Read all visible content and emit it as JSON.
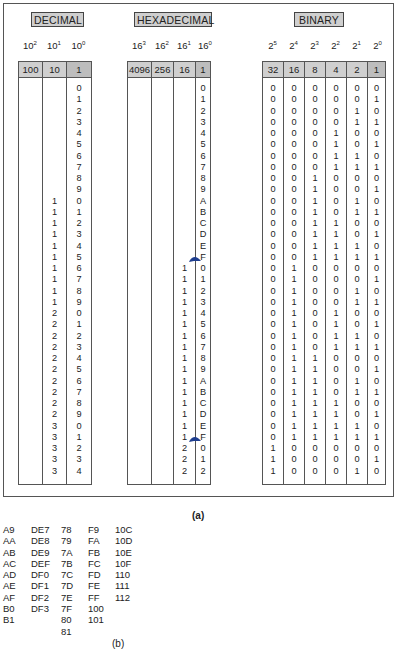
{
  "panel_a": {
    "caption": "(a)",
    "decimal": {
      "title": "DECIMAL",
      "powers": [
        {
          "base": "10",
          "exp": "2"
        },
        {
          "base": "10",
          "exp": "1"
        },
        {
          "base": "10",
          "exp": "0"
        }
      ],
      "weights": [
        "100",
        "10",
        "1"
      ],
      "columns": [
        [],
        [
          "",
          "",
          "",
          "",
          "",
          "",
          "",
          "",
          "",
          "",
          "1",
          "1",
          "1",
          "1",
          "1",
          "1",
          "1",
          "1",
          "1",
          "1",
          "2",
          "2",
          "2",
          "2",
          "2",
          "2",
          "2",
          "2",
          "2",
          "2",
          "3",
          "3",
          "3",
          "3",
          "3"
        ],
        [
          "0",
          "1",
          "2",
          "3",
          "4",
          "5",
          "6",
          "7",
          "8",
          "9",
          "0",
          "1",
          "2",
          "3",
          "4",
          "5",
          "6",
          "7",
          "8",
          "9",
          "0",
          "1",
          "2",
          "3",
          "4",
          "5",
          "6",
          "7",
          "8",
          "9",
          "0",
          "1",
          "2",
          "3",
          "4"
        ]
      ]
    },
    "hexadecimal": {
      "title": "HEXADECIMAL",
      "powers": [
        {
          "base": "16",
          "exp": "3"
        },
        {
          "base": "16",
          "exp": "2"
        },
        {
          "base": "16",
          "exp": "1"
        },
        {
          "base": "16",
          "exp": "0"
        }
      ],
      "weights": [
        "4096",
        "256",
        "16",
        "1"
      ],
      "columns": [
        [],
        [],
        [
          "",
          "",
          "",
          "",
          "",
          "",
          "",
          "",
          "",
          "",
          "",
          "",
          "",
          "",
          "",
          "",
          "1",
          "1",
          "1",
          "1",
          "1",
          "1",
          "1",
          "1",
          "1",
          "1",
          "1",
          "1",
          "1",
          "1",
          "1",
          "1",
          "2",
          "2",
          "2"
        ],
        [
          "0",
          "1",
          "2",
          "3",
          "4",
          "5",
          "6",
          "7",
          "8",
          "9",
          "A",
          "B",
          "C",
          "D",
          "E",
          "F",
          "0",
          "1",
          "2",
          "3",
          "4",
          "5",
          "6",
          "7",
          "8",
          "9",
          "A",
          "B",
          "C",
          "D",
          "E",
          "F",
          "0",
          "1",
          "2"
        ]
      ],
      "carry_arrows": [
        {
          "after_row": 15
        },
        {
          "after_row": 31
        }
      ],
      "arrow_color": "#1f3f8f"
    },
    "binary": {
      "title": "BINARY",
      "powers": [
        {
          "base": "2",
          "exp": "5"
        },
        {
          "base": "2",
          "exp": "4"
        },
        {
          "base": "2",
          "exp": "3"
        },
        {
          "base": "2",
          "exp": "2"
        },
        {
          "base": "2",
          "exp": "1"
        },
        {
          "base": "2",
          "exp": "0"
        }
      ],
      "weights": [
        "32",
        "16",
        "8",
        "4",
        "2",
        "1"
      ],
      "columns": [
        [
          "0",
          "0",
          "0",
          "0",
          "0",
          "0",
          "0",
          "0",
          "0",
          "0",
          "0",
          "0",
          "0",
          "0",
          "0",
          "0",
          "0",
          "0",
          "0",
          "0",
          "0",
          "0",
          "0",
          "0",
          "0",
          "0",
          "0",
          "0",
          "0",
          "0",
          "0",
          "0",
          "1",
          "1",
          "1"
        ],
        [
          "0",
          "0",
          "0",
          "0",
          "0",
          "0",
          "0",
          "0",
          "0",
          "0",
          "0",
          "0",
          "0",
          "0",
          "0",
          "0",
          "1",
          "1",
          "1",
          "1",
          "1",
          "1",
          "1",
          "1",
          "1",
          "1",
          "1",
          "1",
          "1",
          "1",
          "1",
          "1",
          "0",
          "0",
          "0"
        ],
        [
          "0",
          "0",
          "0",
          "0",
          "0",
          "0",
          "0",
          "0",
          "1",
          "1",
          "1",
          "1",
          "1",
          "1",
          "1",
          "1",
          "0",
          "0",
          "0",
          "0",
          "0",
          "0",
          "0",
          "0",
          "1",
          "1",
          "1",
          "1",
          "1",
          "1",
          "1",
          "1",
          "0",
          "0",
          "0"
        ],
        [
          "0",
          "0",
          "0",
          "0",
          "1",
          "1",
          "1",
          "1",
          "0",
          "0",
          "0",
          "0",
          "1",
          "1",
          "1",
          "1",
          "0",
          "0",
          "0",
          "0",
          "1",
          "1",
          "1",
          "1",
          "0",
          "0",
          "0",
          "0",
          "1",
          "1",
          "1",
          "1",
          "0",
          "0",
          "0"
        ],
        [
          "0",
          "0",
          "1",
          "1",
          "0",
          "0",
          "1",
          "1",
          "0",
          "0",
          "1",
          "1",
          "0",
          "0",
          "1",
          "1",
          "0",
          "0",
          "1",
          "1",
          "0",
          "0",
          "1",
          "1",
          "0",
          "0",
          "1",
          "1",
          "0",
          "0",
          "1",
          "1",
          "0",
          "0",
          "1"
        ],
        [
          "0",
          "1",
          "0",
          "1",
          "0",
          "1",
          "0",
          "1",
          "0",
          "1",
          "0",
          "1",
          "0",
          "1",
          "0",
          "1",
          "0",
          "1",
          "0",
          "1",
          "0",
          "1",
          "0",
          "1",
          "0",
          "1",
          "0",
          "1",
          "0",
          "1",
          "0",
          "1",
          "0",
          "1",
          "0"
        ]
      ]
    }
  },
  "panel_b": {
    "caption": "(b)",
    "columns": [
      [
        "A9",
        "AA",
        "AB",
        "AC",
        "AD",
        "AE",
        "AF",
        "B0",
        "B1"
      ],
      [
        "DE7",
        "DE8",
        "DE9",
        "DEF",
        "DF0",
        "DF1",
        "DF2",
        "DF3"
      ],
      [
        "78",
        "79",
        "7A",
        "7B",
        "7C",
        "7D",
        "7E",
        "7F",
        "80",
        "81"
      ],
      [
        "F9",
        "FA",
        "FB",
        "FC",
        "FD",
        "FE",
        "FF",
        "100",
        "101"
      ],
      [
        "10C",
        "10D",
        "10E",
        "10F",
        "110",
        "111",
        "112"
      ]
    ]
  }
}
